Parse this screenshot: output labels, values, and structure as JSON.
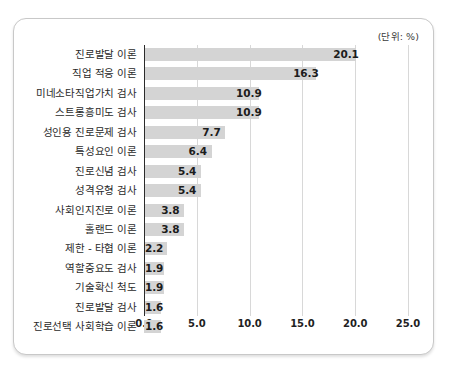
{
  "card": {
    "unit_note": "(단위: %)"
  },
  "chart_data": {
    "type": "bar",
    "orientation": "horizontal",
    "title": "",
    "subtitle": "",
    "xlabel": "",
    "ylabel": "",
    "unit_note": "(단위: %)",
    "xlim": [
      0.0,
      25.0
    ],
    "xticks": [
      "0.0",
      "5.0",
      "10.0",
      "15.0",
      "20.0",
      "25.0"
    ],
    "xtick_values": [
      0.0,
      5.0,
      10.0,
      15.0,
      20.0,
      25.0
    ],
    "grid": true,
    "grid_axis": "x",
    "legend": false,
    "bar_color": "#d4d4d4",
    "axis_color": "#2b2b2b",
    "grid_color": "#d8d8d8",
    "categories": [
      "진로발달 이론",
      "직업 적응 이론",
      "미네소타직업가치 검사",
      "스트롱흥미도 검사",
      "성인용 진로문제 검사",
      "특성요인 이론",
      "진로신념 검사",
      "성격유형 검사",
      "사회인지진로 이론",
      "홀랜드 이론",
      "제한 - 타협 이론",
      "역할중요도 검사",
      "기술확신 척도",
      "진로발달 검사",
      "진로선택 사회학습 이론"
    ],
    "values": [
      20.1,
      16.3,
      10.9,
      10.9,
      7.7,
      6.4,
      5.4,
      5.4,
      3.8,
      3.8,
      2.2,
      1.9,
      1.9,
      1.6,
      1.6
    ],
    "value_labels": [
      "20.1",
      "16.3",
      "10.9",
      "10.9",
      "7.7",
      "6.4",
      "5.4",
      "5.4",
      "3.8",
      "3.8",
      "2.2",
      "1.9",
      "1.9",
      "1.6",
      "1.6"
    ]
  }
}
